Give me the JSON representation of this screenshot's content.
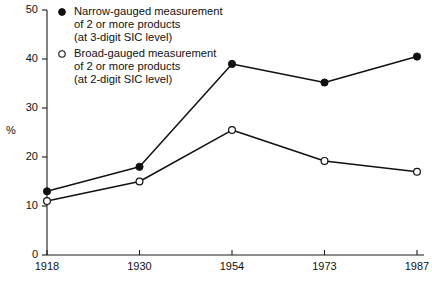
{
  "chart_data": {
    "type": "line",
    "title": "",
    "subtitle": "",
    "xlabel": "",
    "ylabel": "%",
    "categories": [
      "1918",
      "1930",
      "1954",
      "1973",
      "1987"
    ],
    "ylim": [
      0,
      50
    ],
    "yticks": [
      0,
      10,
      20,
      30,
      40,
      50
    ],
    "ytick_labels": [
      "0",
      "10",
      "20",
      "30",
      "40",
      "50"
    ],
    "grid": false,
    "legend_position": "top-left-inside",
    "series": [
      {
        "name": "Narrow-gauged  measurement of 2 or more products (at 3-digit SIC level)",
        "marker": "filled-circle",
        "color": "#111111",
        "values": [
          13.0,
          18.0,
          39.0,
          35.2,
          40.5
        ]
      },
      {
        "name": "Broad-gauged measurement of 2 or more products (at 2-digit SIC level)",
        "marker": "open-circle",
        "color": "#111111",
        "values": [
          11.0,
          15.0,
          25.5,
          19.2,
          17.0
        ]
      }
    ]
  },
  "legend": {
    "entries": [
      {
        "marker": "filled-circle",
        "line1": "Narrow-gauged  measurement",
        "line2": "of 2 or more products",
        "line3": "(at 3-digit SIC level)"
      },
      {
        "marker": "open-circle",
        "line1": "Broad-gauged measurement",
        "line2": "of 2 or more products",
        "line3": "(at 2-digit SIC level)"
      }
    ]
  },
  "axes": {
    "y_unit_label": "%"
  }
}
